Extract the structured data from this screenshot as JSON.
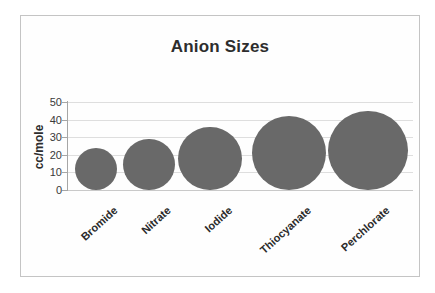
{
  "chart_data": {
    "type": "bubble",
    "title": "Anion Sizes",
    "ylabel": "cc/mole",
    "xlabel": "",
    "categories": [
      "Bromide",
      "Nitrate",
      "Iodide",
      "Thiocyanate",
      "Perchlorate"
    ],
    "values": [
      24,
      29,
      36,
      42,
      45
    ],
    "ylim": [
      0,
      50
    ],
    "yticks": [
      0,
      10,
      20,
      30,
      40,
      50
    ],
    "grid": "horizontal",
    "legend": "none",
    "colors": {
      "bubble_fill": "#696969",
      "gridline": "#dedede",
      "axis": "#a6a6a6",
      "title_text": "#2d2d2d",
      "tick_text": "#3a3a3a",
      "frame_border": "#c4c4c4",
      "background": "#ffffff"
    }
  }
}
